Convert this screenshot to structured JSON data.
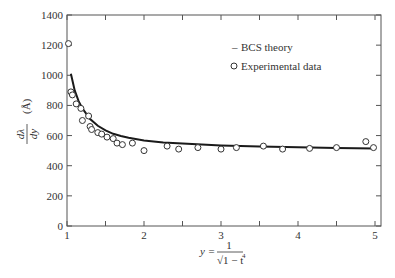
{
  "chart_data": {
    "type": "line",
    "title": "",
    "xlabel": "y = 1/√(1 − t⁴)",
    "ylabel": "dλ/dy (Å)",
    "xlim": [
      1,
      5.1
    ],
    "ylim": [
      0,
      1400
    ],
    "grid": false,
    "legend_position": "upper right (inside)",
    "x_ticks": [
      1,
      1.5,
      2,
      2.5,
      3,
      3.5,
      4,
      4.5,
      5
    ],
    "x_tick_labels": [
      "1",
      "",
      "2",
      "",
      "3",
      "",
      "4",
      "",
      "5"
    ],
    "y_ticks": [
      0,
      200,
      400,
      600,
      800,
      1000,
      1200,
      1400
    ],
    "y_tick_labels": [
      "0",
      "200",
      "400",
      "600",
      "800",
      "1000",
      "1200",
      "1400"
    ],
    "series": [
      {
        "name": "BCS theory",
        "style": "solid line",
        "x": [
          1.05,
          1.1,
          1.15,
          1.2,
          1.3,
          1.4,
          1.5,
          1.6,
          1.7,
          1.8,
          2.0,
          2.25,
          2.5,
          3.0,
          3.5,
          4.0,
          4.5,
          5.0
        ],
        "values": [
          1010,
          900,
          830,
          780,
          710,
          665,
          635,
          612,
          597,
          585,
          568,
          555,
          547,
          535,
          528,
          522,
          518,
          515
        ]
      },
      {
        "name": "Experimental data",
        "style": "open circle markers",
        "x": [
          1.02,
          1.05,
          1.07,
          1.12,
          1.18,
          1.2,
          1.28,
          1.3,
          1.32,
          1.4,
          1.45,
          1.52,
          1.6,
          1.65,
          1.72,
          1.85,
          2.0,
          2.3,
          2.45,
          2.7,
          3.0,
          3.2,
          3.55,
          3.8,
          4.15,
          4.5,
          4.88,
          4.98
        ],
        "values": [
          1210,
          890,
          870,
          810,
          780,
          700,
          730,
          660,
          640,
          620,
          610,
          590,
          580,
          550,
          540,
          550,
          500,
          530,
          510,
          520,
          510,
          520,
          530,
          510,
          515,
          520,
          560,
          520
        ]
      }
    ]
  },
  "legend": {
    "items": [
      {
        "symbol": "–",
        "label": "BCS theory"
      },
      {
        "symbol": "o",
        "label": "Experimental data"
      }
    ]
  },
  "axes": {
    "x_label_lhs": "y =",
    "x_label_num": "1",
    "x_label_den": "√1 − t",
    "x_label_exp": "4",
    "y_label_num": "dλ",
    "y_label_den": "dy",
    "y_label_unit": "(Å)"
  },
  "colors": {
    "axis": "#555555",
    "curve": "#1a1a1a",
    "marker": "#333333"
  }
}
